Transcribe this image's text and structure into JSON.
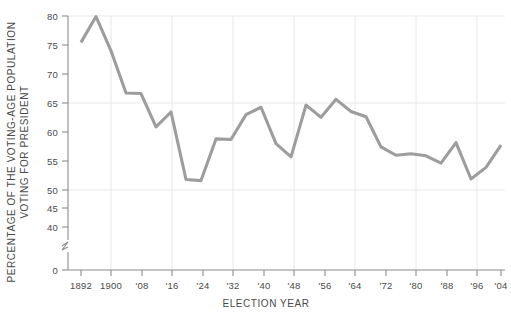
{
  "chart_data": {
    "type": "line",
    "title": "",
    "xlabel": "ELECTION YEAR",
    "ylabel": "PERCENTAGE OF THE VOTING-AGE POPULATION VOTING FOR PRESIDENT",
    "ylabel_line1": "PERCENTAGE OF THE VOTING-AGE POPULATION",
    "ylabel_line2": "VOTING FOR PRESIDENT",
    "ylim": [
      38,
      81
    ],
    "y_axis_break": true,
    "y_zero_shown": true,
    "yticks": [
      0,
      40,
      45,
      50,
      55,
      60,
      65,
      70,
      75,
      80
    ],
    "ytick_labels": [
      "0",
      "40",
      "45",
      "50",
      "55",
      "60",
      "65",
      "70",
      "75",
      "80"
    ],
    "gridlines_y": [
      50,
      65,
      80
    ],
    "gridlines_x": [
      "1900",
      "'16",
      "'32",
      "'48",
      "'64",
      "'80",
      "'96"
    ],
    "grid": true,
    "legend": "none",
    "line_color": "#9d9d9d",
    "axis_color": "#8c8c8c",
    "grid_color": "#e8e8e8",
    "text_color": "#4a4a4a",
    "xtick_labels": [
      "1892",
      "1900",
      "'08",
      "'16",
      "'24",
      "'32",
      "'40",
      "'48",
      "'56",
      "'64",
      "'72",
      "'80",
      "'88",
      "'96",
      "'04"
    ],
    "x": [
      1892,
      1896,
      1900,
      1904,
      1908,
      1912,
      1916,
      1920,
      1924,
      1928,
      1932,
      1936,
      1940,
      1944,
      1948,
      1952,
      1956,
      1960,
      1964,
      1968,
      1972,
      1976,
      1980,
      1984,
      1988,
      1992,
      1996,
      2000,
      2004
    ],
    "values": [
      75.0,
      79.9,
      73.4,
      65.4,
      65.3,
      59.0,
      61.8,
      49.0,
      48.8,
      56.7,
      56.6,
      61.3,
      62.7,
      55.8,
      53.3,
      63.1,
      60.8,
      64.2,
      61.9,
      60.9,
      55.2,
      53.6,
      53.9,
      53.5,
      52.1,
      56.0,
      49.1,
      51.3,
      55.5
    ]
  }
}
